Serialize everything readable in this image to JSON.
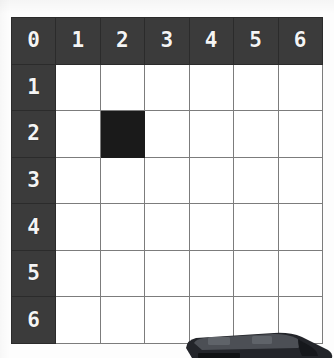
{
  "board": {
    "title": "7x7 coordinate grid board",
    "rows": 7,
    "cols": 7,
    "column_headers": [
      "0",
      "1",
      "2",
      "3",
      "4",
      "5",
      "6"
    ],
    "row_headers": [
      "1",
      "2",
      "3",
      "4",
      "5",
      "6"
    ],
    "corner_label": "0",
    "filled_cells": [
      {
        "col": 2,
        "row": 2,
        "label": ""
      }
    ],
    "cells": [
      [
        "0",
        "1",
        "2",
        "3",
        "4",
        "5",
        "6"
      ],
      [
        "1",
        "",
        "",
        "",
        "",
        "",
        ""
      ],
      [
        "2",
        "",
        "",
        "",
        "",
        "",
        ""
      ],
      [
        "3",
        "",
        "",
        "",
        "",
        "",
        ""
      ],
      [
        "4",
        "",
        "",
        "",
        "",
        "",
        ""
      ],
      [
        "5",
        "",
        "",
        "",
        "",
        "",
        ""
      ],
      [
        "6",
        "",
        "",
        "",
        "",
        "",
        ""
      ]
    ]
  },
  "colors": {
    "header_background": "#3b3b3b",
    "header_text": "#f4f4f4",
    "cell_background": "#ffffff",
    "grid_line": "#7c7c7c",
    "filled_cell": "#1a1a1a",
    "page_background": "#fdfdfd",
    "object_dark": "#23252a",
    "object_mid": "#4c4f55",
    "object_light": "#6e7278"
  },
  "bottom_object": {
    "name": "toy-car",
    "description": "dark grey vehicle partially cropped at the bottom edge"
  }
}
